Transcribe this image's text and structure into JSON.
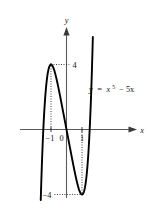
{
  "figure": {
    "title": "",
    "background_color": "#ffffff",
    "curve_color": "#000000",
    "axis_color": "#5a5a5a",
    "equation_label": {
      "lhs": "y",
      "equals": "=",
      "base": "x",
      "exponent": "5",
      "rest": "− 5x",
      "full": "y = x⁵ − 5x"
    },
    "axis_labels": {
      "x": "x",
      "y": "y"
    },
    "x_ticks": [
      {
        "label": "−1",
        "value": -1
      },
      {
        "label": "0",
        "value": 0
      },
      {
        "label": "1",
        "value": 1
      }
    ],
    "y_ticks": [
      {
        "label": "4",
        "value": 4
      },
      {
        "label": "−4",
        "value": -4
      }
    ]
  },
  "chart_data": {
    "type": "line",
    "title": "",
    "subtitle": "",
    "xlabel": "x",
    "ylabel": "y",
    "xlim": [
      -2.45,
      2.45
    ],
    "ylim": [
      -7.2,
      7.2
    ],
    "grid": false,
    "legend": null,
    "annotations": [
      {
        "text": "y = x⁵ − 5x",
        "x": 1.85,
        "y": 2.9
      },
      {
        "text": "4",
        "x": 0.22,
        "y": 4.0
      },
      {
        "text": "−4",
        "x": -0.95,
        "y": -4.0
      },
      {
        "text": "−1",
        "x": -1.05,
        "y": -0.62
      },
      {
        "text": "0",
        "x": -0.3,
        "y": -0.62
      },
      {
        "text": "1",
        "x": 0.95,
        "y": -0.62
      }
    ],
    "guide_lines": [
      {
        "type": "vertical",
        "x": -1,
        "from_y": 0,
        "to_y": 4
      },
      {
        "type": "horizontal",
        "y": 4,
        "from_x": -1,
        "to_x": 0.18
      },
      {
        "type": "vertical",
        "x": 1,
        "from_y": 0,
        "to_y": -4
      },
      {
        "type": "horizontal",
        "y": -4,
        "from_x": -0.78,
        "to_x": 1
      }
    ],
    "key_points": [
      {
        "name": "local-maximum",
        "x": -1,
        "y": 4
      },
      {
        "name": "local-minimum",
        "x": 1,
        "y": -4
      },
      {
        "name": "x-intercept-left",
        "x": -2.236,
        "y": 0
      },
      {
        "name": "x-intercept-origin",
        "x": 0,
        "y": 0
      },
      {
        "name": "x-intercept-right",
        "x": 2.236,
        "y": 0
      }
    ],
    "series": [
      {
        "name": "y = x^5 - 5x",
        "x": [
          -1.55,
          -1.5,
          -1.45,
          -1.4,
          -1.35,
          -1.3,
          -1.25,
          -1.2,
          -1.15,
          -1.1,
          -1.05,
          -1.0,
          -0.95,
          -0.9,
          -0.85,
          -0.8,
          -0.75,
          -0.7,
          -0.65,
          -0.6,
          -0.55,
          -0.5,
          -0.45,
          -0.4,
          -0.35,
          -0.3,
          -0.25,
          -0.2,
          -0.15,
          -0.1,
          -0.05,
          0.0,
          0.05,
          0.1,
          0.15,
          0.2,
          0.25,
          0.3,
          0.35,
          0.4,
          0.45,
          0.5,
          0.55,
          0.6,
          0.65,
          0.7,
          0.75,
          0.8,
          0.85,
          0.9,
          0.95,
          1.0,
          1.05,
          1.1,
          1.15,
          1.2,
          1.25,
          1.3,
          1.35,
          1.4,
          1.45,
          1.5,
          1.55
        ],
        "y": [
          -1.2,
          0.9,
          2.84,
          4.62,
          6.26,
          7.78,
          9.17,
          10.49,
          11.7,
          12.89,
          14.01,
          4.0,
          3.98,
          3.91,
          3.81,
          3.67,
          3.51,
          3.33,
          3.13,
          2.92,
          2.7,
          2.47,
          2.23,
          1.99,
          1.74,
          1.5,
          1.25,
          1.0,
          0.75,
          0.5,
          0.25,
          0.0,
          -0.25,
          -0.5,
          -0.75,
          -1.0,
          -1.25,
          -1.5,
          -1.74,
          -1.99,
          -2.23,
          -2.47,
          -2.7,
          -2.92,
          -3.13,
          -3.33,
          -3.51,
          -3.67,
          -3.81,
          -3.91,
          -3.98,
          -4.0,
          -3.97,
          -3.89,
          -3.74,
          -3.51,
          -3.2,
          -2.79,
          -2.27,
          -1.62,
          -0.84,
          0.09,
          1.2
        ]
      }
    ]
  }
}
